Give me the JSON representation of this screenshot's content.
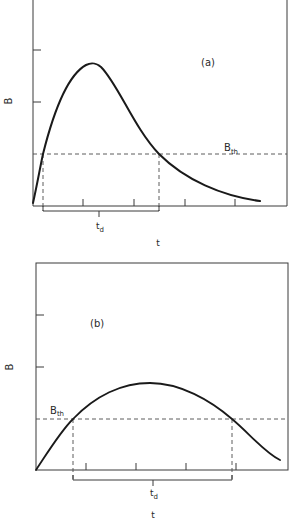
{
  "figure": {
    "panels": [
      {
        "id": "a",
        "panel_label": "(a)",
        "y_axis_label": "B",
        "x_axis_label": "t",
        "threshold_label": "B",
        "threshold_subscript": "th",
        "duration_label": "t",
        "duration_subscript": "d",
        "curve_shape": "sharp rise to early peak, then exponential-like decay",
        "y_ticks": 2,
        "x_ticks": 4
      },
      {
        "id": "b",
        "panel_label": "(b)",
        "y_axis_label": "B",
        "x_axis_label": "t",
        "threshold_label": "B",
        "threshold_subscript": "th",
        "duration_label": "t",
        "duration_subscript": "d",
        "curve_shape": "broad low hump, long time above threshold",
        "y_ticks": 2,
        "x_ticks": 4
      }
    ]
  },
  "colors": {
    "curve": "#1a1a1a",
    "axis": "#3a3a3a",
    "dashed": "#4a4a4a"
  }
}
